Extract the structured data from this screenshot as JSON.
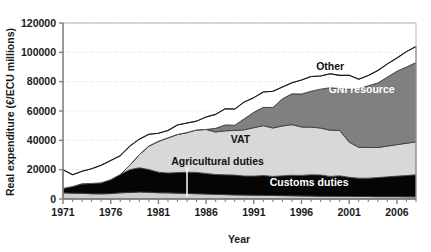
{
  "chart_data": {
    "type": "area",
    "title": "",
    "xlabel": "Year",
    "ylabel": "Real expenditure (€/ECU millions)",
    "xlim": [
      1971,
      2008
    ],
    "ylim": [
      0,
      120000
    ],
    "grid": true,
    "stacked": true,
    "legend_position": "inline-labels",
    "ytick_labels": [
      "0",
      "20000",
      "40000",
      "60000",
      "80000",
      "100000",
      "120000"
    ],
    "ytick_values": [
      0,
      20000,
      40000,
      60000,
      80000,
      100000,
      120000
    ],
    "xtick_labels": [
      "1971",
      "1976",
      "1981",
      "1986",
      "1991",
      "1996",
      "2001",
      "2006"
    ],
    "xtick_values": [
      1971,
      1976,
      1981,
      1986,
      1991,
      1996,
      2001,
      2006
    ],
    "x": [
      1971,
      1972,
      1973,
      1974,
      1975,
      1976,
      1977,
      1978,
      1979,
      1980,
      1981,
      1982,
      1983,
      1984,
      1985,
      1986,
      1987,
      1988,
      1989,
      1990,
      1991,
      1992,
      1993,
      1994,
      1995,
      1996,
      1997,
      1998,
      1999,
      2000,
      2001,
      2002,
      2003,
      2004,
      2005,
      2006,
      2007,
      2008
    ],
    "series": [
      {
        "name": "Agricultural duties",
        "color": "#cfcfcf",
        "label_color": "dark",
        "values": [
          4200,
          4000,
          3900,
          3600,
          3500,
          3700,
          4200,
          4500,
          4800,
          4600,
          4300,
          4200,
          4000,
          3800,
          3600,
          3400,
          3200,
          3000,
          2800,
          2700,
          2600,
          2500,
          2400,
          2300,
          2200,
          2100,
          2000,
          1900,
          1900,
          1800,
          1800,
          1700,
          1700,
          1600,
          1600,
          1600,
          1500,
          1500
        ]
      },
      {
        "name": "Customs duties",
        "color": "#050505",
        "label_color": "light",
        "values": [
          3000,
          4500,
          6500,
          7000,
          7500,
          9500,
          12500,
          15500,
          16500,
          15500,
          14000,
          13500,
          14000,
          14500,
          14500,
          14000,
          13500,
          13500,
          13500,
          13000,
          13000,
          13500,
          13000,
          13500,
          14000,
          14000,
          14500,
          14500,
          13500,
          14000,
          13000,
          12500,
          12500,
          13000,
          13500,
          14000,
          14500,
          15000
        ]
      },
      {
        "name": "VAT",
        "color": "#d8d8d8",
        "label_color": "dark",
        "values": [
          0,
          0,
          0,
          0,
          0,
          0,
          0,
          3000,
          9000,
          16000,
          21000,
          24000,
          26000,
          27000,
          29000,
          30000,
          29000,
          30000,
          30500,
          31500,
          33000,
          34000,
          33000,
          34000,
          34500,
          33000,
          32500,
          32000,
          31500,
          31000,
          24000,
          21000,
          21000,
          20500,
          21000,
          21500,
          22000,
          22500
        ]
      },
      {
        "name": "GNI resource",
        "color": "#808080",
        "label_color": "light",
        "values": [
          0,
          0,
          0,
          0,
          0,
          0,
          0,
          0,
          0,
          0,
          0,
          0,
          0,
          0,
          0,
          0,
          2500,
          4000,
          3500,
          7500,
          10500,
          12500,
          14000,
          18500,
          21000,
          22500,
          24500,
          26500,
          29000,
          28500,
          36000,
          40000,
          42000,
          44000,
          47000,
          50000,
          52000,
          54000
        ]
      },
      {
        "name": "Other",
        "color": "#ffffff",
        "label_color": "dark",
        "values": [
          12800,
          8000,
          8500,
          10000,
          12000,
          13000,
          12800,
          13000,
          10500,
          8000,
          5500,
          5000,
          6500,
          6500,
          6000,
          8500,
          9500,
          11000,
          11000,
          11500,
          10000,
          10500,
          11000,
          8000,
          7500,
          9500,
          10000,
          9000,
          9500,
          9000,
          9500,
          6500,
          7000,
          8500,
          9000,
          9000,
          10500,
          11000
        ]
      }
    ],
    "annotations": [
      {
        "text": "Other",
        "x": 1999.0,
        "y": 88000,
        "color": "dark",
        "anchor": "middle"
      },
      {
        "text": "GNI resource",
        "x": 2002.3,
        "y": 72000,
        "color": "light",
        "anchor": "middle"
      },
      {
        "text": "VAT",
        "x": 1989.6,
        "y": 38000,
        "color": "dark",
        "anchor": "middle"
      },
      {
        "text": "Agricultural duties",
        "x": 1987.2,
        "y": 23500,
        "color": "dark",
        "anchor": "middle"
      },
      {
        "text": "Customs duties",
        "x": 1996.8,
        "y": 9000,
        "color": "light",
        "anchor": "middle"
      }
    ],
    "leader": {
      "x": 1984.0,
      "y_top": 21500,
      "y_bottom": 1500
    }
  }
}
